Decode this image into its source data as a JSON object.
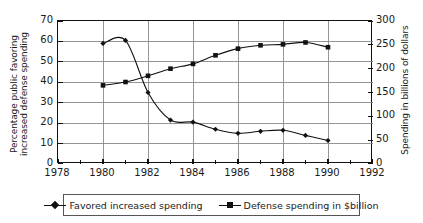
{
  "chart_data": {
    "type": "line",
    "title": "",
    "xlabel": "",
    "ylabel": "Percentage public favoring increased defense spending",
    "ylabel_line1": "Percentage public favoring",
    "ylabel_line2": "increased defense spending",
    "ylabel_right": "Spending in billions of dollars",
    "xlim": [
      1978,
      1992
    ],
    "ylim": [
      0,
      70
    ],
    "ylim_right": [
      0,
      300
    ],
    "xticks": [
      1978,
      1980,
      1982,
      1984,
      1986,
      1988,
      1990,
      1992
    ],
    "xticks_minor": [
      1979,
      1981,
      1983,
      1985,
      1987,
      1989,
      1991
    ],
    "yticks_left": [
      0,
      10,
      20,
      30,
      40,
      50,
      60,
      70
    ],
    "yticks_right": [
      0,
      50,
      100,
      150,
      200,
      250,
      300
    ],
    "grid": true,
    "legend_position": "below",
    "x": [
      1980,
      1981,
      1982,
      1983,
      1984,
      1985,
      1986,
      1987,
      1988,
      1989,
      1990
    ],
    "series": [
      {
        "name": "Favored increased spending",
        "marker": "diamond",
        "axis": "left",
        "values": [
          59,
          60.5,
          35,
          21.5,
          20.5,
          17,
          15,
          16,
          16.5,
          14,
          11.5
        ]
      },
      {
        "name": "Defense spending in $billion",
        "marker": "square",
        "axis": "right",
        "values": [
          165,
          172,
          185,
          200,
          210,
          228,
          242,
          249,
          251,
          255,
          245
        ]
      }
    ]
  },
  "legend": {
    "items": [
      {
        "label": "Favored increased spending",
        "marker": "diamond"
      },
      {
        "label": "Defense spending in $billion",
        "marker": "square"
      }
    ]
  },
  "colors": {
    "line": "#111111",
    "frame": "#111111",
    "grid": "#8a8a8a",
    "background": "#ffffff"
  }
}
